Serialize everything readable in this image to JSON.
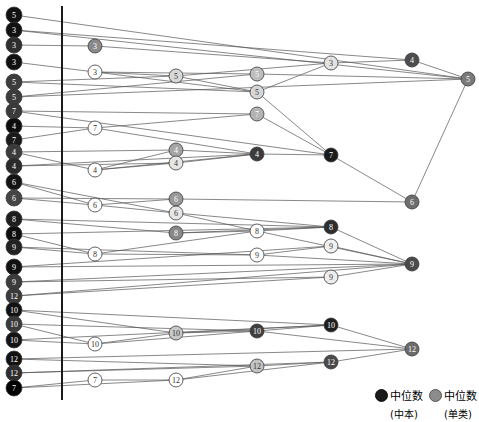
{
  "figure": {
    "type": "dendrogram-merge-diagram",
    "width": 479,
    "height": 422,
    "background": "#ffffff",
    "axis_line": {
      "x": 62,
      "y1": 6,
      "y2": 400,
      "color": "#1a1a1a",
      "width": 2
    }
  },
  "legend": {
    "items": [
      {
        "marker": "dark-circle",
        "color": "#1a1a1a",
        "label": "中位数",
        "sublabel": "(中本)"
      },
      {
        "marker": "light-circle",
        "color": "#8c8c8c",
        "label": "中位数",
        "sublabel": "(单类)"
      }
    ]
  },
  "chart_data": {
    "type": "scatter",
    "title": "",
    "xlabel": "",
    "ylabel": "",
    "xlim": [
      0,
      479
    ],
    "ylim": [
      0,
      422
    ],
    "grid": false,
    "legend_position": "bottom-right",
    "node_radius": {
      "leaf": 7.5,
      "inner": 6.5,
      "root": 7
    },
    "colors": {
      "dark": "#1a1a1a",
      "mid": "#4a4a4a",
      "grey": "#7d7d7d",
      "light": "#d9d9d9",
      "edge": "#555555"
    },
    "nodes": [
      {
        "id": "L0",
        "label": "5",
        "x": 14,
        "y": 15,
        "r": 8,
        "fill": "#111111",
        "text": "#ffffff",
        "col": 0
      },
      {
        "id": "L1",
        "label": "3",
        "x": 14,
        "y": 30,
        "r": 8,
        "fill": "#111111",
        "text": "#ffffff",
        "col": 0
      },
      {
        "id": "L2",
        "label": "3",
        "x": 14,
        "y": 45,
        "r": 8,
        "fill": "#2e2e2e",
        "text": "#ffffff",
        "col": 0
      },
      {
        "id": "L3",
        "label": "3",
        "x": 14,
        "y": 62,
        "r": 8,
        "fill": "#111111",
        "text": "#ffffff",
        "col": 0
      },
      {
        "id": "L4",
        "label": "5",
        "x": 14,
        "y": 82,
        "r": 8,
        "fill": "#3c3c3c",
        "text": "#ffffff",
        "col": 0
      },
      {
        "id": "L5",
        "label": "5",
        "x": 14,
        "y": 97,
        "r": 8,
        "fill": "#3c3c3c",
        "text": "#ffffff",
        "col": 0
      },
      {
        "id": "L6",
        "label": "7",
        "x": 14,
        "y": 111,
        "r": 8,
        "fill": "#3a3a3a",
        "text": "#ffffff",
        "col": 0
      },
      {
        "id": "L7",
        "label": "4",
        "x": 14,
        "y": 126,
        "r": 8,
        "fill": "#0d0d0d",
        "text": "#ffffff",
        "col": 0
      },
      {
        "id": "L8",
        "label": "7",
        "x": 14,
        "y": 140,
        "r": 8,
        "fill": "#1a1a1a",
        "text": "#ffffff",
        "col": 0
      },
      {
        "id": "L9",
        "label": "4",
        "x": 14,
        "y": 152,
        "r": 8,
        "fill": "#3c3c3c",
        "text": "#ffffff",
        "col": 0
      },
      {
        "id": "L10",
        "label": "4",
        "x": 14,
        "y": 166,
        "r": 8,
        "fill": "#2b2b2b",
        "text": "#ffffff",
        "col": 0
      },
      {
        "id": "L11",
        "label": "6",
        "x": 14,
        "y": 182,
        "r": 8,
        "fill": "#141414",
        "text": "#ffffff",
        "col": 0
      },
      {
        "id": "L12",
        "label": "6",
        "x": 14,
        "y": 198,
        "r": 8,
        "fill": "#454545",
        "text": "#ffffff",
        "col": 0
      },
      {
        "id": "L13",
        "label": "8",
        "x": 14,
        "y": 219,
        "r": 8,
        "fill": "#1e1e1e",
        "text": "#ffffff",
        "col": 0
      },
      {
        "id": "L14",
        "label": "8",
        "x": 14,
        "y": 234,
        "r": 8,
        "fill": "#0d0d0d",
        "text": "#ffffff",
        "col": 0
      },
      {
        "id": "L15",
        "label": "9",
        "x": 14,
        "y": 247,
        "r": 8,
        "fill": "#222222",
        "text": "#ffffff",
        "col": 0
      },
      {
        "id": "L16",
        "label": "9",
        "x": 14,
        "y": 267,
        "r": 8,
        "fill": "#111111",
        "text": "#ffffff",
        "col": 0
      },
      {
        "id": "L17",
        "label": "9",
        "x": 14,
        "y": 282,
        "r": 8,
        "fill": "#3c3c3c",
        "text": "#ffffff",
        "col": 0
      },
      {
        "id": "L18",
        "label": "12",
        "x": 14,
        "y": 296,
        "r": 8,
        "fill": "#3a3a3a",
        "text": "#ffffff",
        "col": 0
      },
      {
        "id": "L19",
        "label": "10",
        "x": 14,
        "y": 310,
        "r": 8,
        "fill": "#111111",
        "text": "#ffffff",
        "col": 0
      },
      {
        "id": "L20",
        "label": "10",
        "x": 14,
        "y": 324,
        "r": 8,
        "fill": "#3a3a3a",
        "text": "#ffffff",
        "col": 0
      },
      {
        "id": "L21",
        "label": "10",
        "x": 14,
        "y": 340,
        "r": 8,
        "fill": "#141414",
        "text": "#ffffff",
        "col": 0
      },
      {
        "id": "L22",
        "label": "12",
        "x": 14,
        "y": 359,
        "r": 8,
        "fill": "#111111",
        "text": "#ffffff",
        "col": 0
      },
      {
        "id": "L23",
        "label": "12",
        "x": 14,
        "y": 373,
        "r": 8,
        "fill": "#2e2e2e",
        "text": "#ffffff",
        "col": 0
      },
      {
        "id": "L24",
        "label": "7",
        "x": 14,
        "y": 388,
        "r": 8,
        "fill": "#000000",
        "text": "#ffffff",
        "col": 0
      },
      {
        "id": "A0",
        "label": "3",
        "x": 95,
        "y": 46,
        "r": 7,
        "fill": "#8a8a8a",
        "text": "#ffffff",
        "col": 1
      },
      {
        "id": "A1",
        "label": "3",
        "x": 95,
        "y": 72,
        "r": 7,
        "fill": "#ffffff",
        "text": "#333333",
        "col": 1
      },
      {
        "id": "A2",
        "label": "7",
        "x": 95,
        "y": 128,
        "r": 7,
        "fill": "#ffffff",
        "text": "#333333",
        "col": 1
      },
      {
        "id": "A3",
        "label": "4",
        "x": 95,
        "y": 170,
        "r": 7,
        "fill": "#ffffff",
        "text": "#333333",
        "col": 1
      },
      {
        "id": "A4",
        "label": "6",
        "x": 95,
        "y": 205,
        "r": 7,
        "fill": "#ffffff",
        "text": "#333333",
        "col": 1
      },
      {
        "id": "A5",
        "label": "8",
        "x": 95,
        "y": 254,
        "r": 7,
        "fill": "#ffffff",
        "text": "#333333",
        "col": 1
      },
      {
        "id": "A6",
        "label": "10",
        "x": 95,
        "y": 344,
        "r": 7,
        "fill": "#ffffff",
        "text": "#333333",
        "col": 1
      },
      {
        "id": "A7",
        "label": "7",
        "x": 95,
        "y": 380,
        "r": 7,
        "fill": "#ffffff",
        "text": "#333333",
        "col": 1
      },
      {
        "id": "B0",
        "label": "5",
        "x": 176,
        "y": 76,
        "r": 7,
        "fill": "#d8d8d8",
        "text": "#333333",
        "col": 2
      },
      {
        "id": "B1",
        "label": "4",
        "x": 176,
        "y": 150,
        "r": 7,
        "fill": "#a6a6a6",
        "text": "#ffffff",
        "col": 2
      },
      {
        "id": "B2",
        "label": "4",
        "x": 176,
        "y": 163,
        "r": 7,
        "fill": "#e6e6e6",
        "text": "#333333",
        "col": 2
      },
      {
        "id": "B3",
        "label": "6",
        "x": 176,
        "y": 199,
        "r": 7,
        "fill": "#9a9a9a",
        "text": "#ffffff",
        "col": 2
      },
      {
        "id": "B4",
        "label": "6",
        "x": 176,
        "y": 213,
        "r": 7,
        "fill": "#e6e6e6",
        "text": "#333333",
        "col": 2
      },
      {
        "id": "B5",
        "label": "8",
        "x": 176,
        "y": 233,
        "r": 7,
        "fill": "#888888",
        "text": "#ffffff",
        "col": 2
      },
      {
        "id": "B6",
        "label": "10",
        "x": 176,
        "y": 333,
        "r": 7,
        "fill": "#c8c8c8",
        "text": "#333333",
        "col": 2
      },
      {
        "id": "B7",
        "label": "12",
        "x": 176,
        "y": 380,
        "r": 7,
        "fill": "#ffffff",
        "text": "#333333",
        "col": 2
      },
      {
        "id": "C0",
        "label": "5",
        "x": 257,
        "y": 74,
        "r": 7,
        "fill": "#bdbdbd",
        "text": "#ffffff",
        "col": 3
      },
      {
        "id": "C1",
        "label": "5",
        "x": 257,
        "y": 92,
        "r": 7,
        "fill": "#d6d6d6",
        "text": "#333333",
        "col": 3
      },
      {
        "id": "C2",
        "label": "7",
        "x": 257,
        "y": 114,
        "r": 7,
        "fill": "#b3b3b3",
        "text": "#ffffff",
        "col": 3
      },
      {
        "id": "C3",
        "label": "4",
        "x": 257,
        "y": 154,
        "r": 7,
        "fill": "#3c3c3c",
        "text": "#ffffff",
        "col": 3
      },
      {
        "id": "C4",
        "label": "8",
        "x": 257,
        "y": 231,
        "r": 7,
        "fill": "#ffffff",
        "text": "#333333",
        "col": 3
      },
      {
        "id": "C5",
        "label": "9",
        "x": 257,
        "y": 255,
        "r": 7,
        "fill": "#ffffff",
        "text": "#333333",
        "col": 3
      },
      {
        "id": "C6",
        "label": "10",
        "x": 257,
        "y": 331,
        "r": 7,
        "fill": "#3f3f3f",
        "text": "#ffffff",
        "col": 3
      },
      {
        "id": "C7",
        "label": "12",
        "x": 257,
        "y": 366,
        "r": 7,
        "fill": "#c2c2c2",
        "text": "#333333",
        "col": 3
      },
      {
        "id": "D0",
        "label": "3",
        "x": 331,
        "y": 63,
        "r": 7,
        "fill": "#e2e2e2",
        "text": "#333333",
        "col": 4
      },
      {
        "id": "D1",
        "label": "7",
        "x": 331,
        "y": 155,
        "r": 7,
        "fill": "#1a1a1a",
        "text": "#ffffff",
        "col": 4
      },
      {
        "id": "D2",
        "label": "8",
        "x": 331,
        "y": 227,
        "r": 7,
        "fill": "#2e2e2e",
        "text": "#ffffff",
        "col": 4
      },
      {
        "id": "D3",
        "label": "9",
        "x": 331,
        "y": 246,
        "r": 7,
        "fill": "#f0f0f0",
        "text": "#333333",
        "col": 4
      },
      {
        "id": "D4",
        "label": "9",
        "x": 331,
        "y": 277,
        "r": 7,
        "fill": "#ededed",
        "text": "#333333",
        "col": 4
      },
      {
        "id": "D5",
        "label": "10",
        "x": 331,
        "y": 325,
        "r": 7,
        "fill": "#1e1e1e",
        "text": "#ffffff",
        "col": 4
      },
      {
        "id": "D6",
        "label": "12",
        "x": 331,
        "y": 362,
        "r": 7,
        "fill": "#4a4a4a",
        "text": "#ffffff",
        "col": 4
      },
      {
        "id": "E0",
        "label": "4",
        "x": 412,
        "y": 60,
        "r": 7,
        "fill": "#4d4d4d",
        "text": "#ffffff",
        "col": 5
      },
      {
        "id": "E1",
        "label": "6",
        "x": 412,
        "y": 202,
        "r": 7,
        "fill": "#6e6e6e",
        "text": "#ffffff",
        "col": 5
      },
      {
        "id": "E2",
        "label": "9",
        "x": 412,
        "y": 264,
        "r": 7,
        "fill": "#4a4a4a",
        "text": "#ffffff",
        "col": 5
      },
      {
        "id": "E3",
        "label": "12",
        "x": 412,
        "y": 349,
        "r": 7,
        "fill": "#6b6b6b",
        "text": "#ffffff",
        "col": 5
      },
      {
        "id": "R0",
        "label": "5",
        "x": 468,
        "y": 79,
        "r": 7,
        "fill": "#7a7a7a",
        "text": "#ffffff",
        "col": 6
      }
    ],
    "edges": [
      {
        "from": "L0",
        "to": "R0"
      },
      {
        "from": "L1",
        "to": "E0"
      },
      {
        "from": "L2",
        "to": "A0"
      },
      {
        "from": "A0",
        "to": "D0"
      },
      {
        "from": "L3",
        "to": "A1"
      },
      {
        "from": "A1",
        "to": "B0"
      },
      {
        "from": "A1",
        "to": "C0"
      },
      {
        "from": "A1",
        "to": "C1"
      },
      {
        "from": "L4",
        "to": "B0"
      },
      {
        "from": "L5",
        "to": "C0"
      },
      {
        "from": "B0",
        "to": "C1"
      },
      {
        "from": "B0",
        "to": "D0"
      },
      {
        "from": "C0",
        "to": "R0"
      },
      {
        "from": "C1",
        "to": "D0"
      },
      {
        "from": "D0",
        "to": "E0"
      },
      {
        "from": "E0",
        "to": "R0"
      },
      {
        "from": "L6",
        "to": "C2"
      },
      {
        "from": "L7",
        "to": "A2"
      },
      {
        "from": "L8",
        "to": "A2"
      },
      {
        "from": "A2",
        "to": "C2"
      },
      {
        "from": "A2",
        "to": "C3"
      },
      {
        "from": "L9",
        "to": "B1"
      },
      {
        "from": "L10",
        "to": "B2"
      },
      {
        "from": "A3",
        "to": "B1"
      },
      {
        "from": "A3",
        "to": "B2"
      },
      {
        "from": "A3",
        "to": "C3"
      },
      {
        "from": "L9",
        "to": "A3"
      },
      {
        "from": "B1",
        "to": "C3"
      },
      {
        "from": "B2",
        "to": "C3"
      },
      {
        "from": "C2",
        "to": "D1"
      },
      {
        "from": "C3",
        "to": "D1"
      },
      {
        "from": "D1",
        "to": "E1"
      },
      {
        "from": "C1",
        "to": "D1"
      },
      {
        "from": "L11",
        "to": "A4"
      },
      {
        "from": "L12",
        "to": "A4"
      },
      {
        "from": "A4",
        "to": "B3"
      },
      {
        "from": "A4",
        "to": "B4"
      },
      {
        "from": "B3",
        "to": "E1"
      },
      {
        "from": "B4",
        "to": "C4"
      },
      {
        "from": "B4",
        "to": "D2"
      },
      {
        "from": "L13",
        "to": "B5"
      },
      {
        "from": "L14",
        "to": "A5"
      },
      {
        "from": "L15",
        "to": "A5"
      },
      {
        "from": "A5",
        "to": "C4"
      },
      {
        "from": "A5",
        "to": "C5"
      },
      {
        "from": "B5",
        "to": "C4"
      },
      {
        "from": "B5",
        "to": "D2"
      },
      {
        "from": "C4",
        "to": "D2"
      },
      {
        "from": "C4",
        "to": "E2"
      },
      {
        "from": "C5",
        "to": "D3"
      },
      {
        "from": "C5",
        "to": "E2"
      },
      {
        "from": "D2",
        "to": "E2"
      },
      {
        "from": "D3",
        "to": "E2"
      },
      {
        "from": "L16",
        "to": "D3"
      },
      {
        "from": "L17",
        "to": "D4"
      },
      {
        "from": "D4",
        "to": "E2"
      },
      {
        "from": "L18",
        "to": "D4"
      },
      {
        "from": "L19",
        "to": "B6"
      },
      {
        "from": "L20",
        "to": "A6"
      },
      {
        "from": "L21",
        "to": "A6"
      },
      {
        "from": "A6",
        "to": "B6"
      },
      {
        "from": "A6",
        "to": "C6"
      },
      {
        "from": "B6",
        "to": "C6"
      },
      {
        "from": "B6",
        "to": "D5"
      },
      {
        "from": "C6",
        "to": "D5"
      },
      {
        "from": "C6",
        "to": "E3"
      },
      {
        "from": "D5",
        "to": "E3"
      },
      {
        "from": "L22",
        "to": "C7"
      },
      {
        "from": "L23",
        "to": "C7"
      },
      {
        "from": "L24",
        "to": "A7"
      },
      {
        "from": "A7",
        "to": "B7"
      },
      {
        "from": "B7",
        "to": "C7"
      },
      {
        "from": "B7",
        "to": "D6"
      },
      {
        "from": "C7",
        "to": "D6"
      },
      {
        "from": "D6",
        "to": "E3"
      },
      {
        "from": "E1",
        "to": "R0"
      },
      {
        "from": "L12",
        "to": "B3"
      },
      {
        "from": "L13",
        "to": "D2"
      },
      {
        "from": "L16",
        "to": "E2"
      },
      {
        "from": "L19",
        "to": "D5"
      },
      {
        "from": "L22",
        "to": "E3"
      },
      {
        "from": "L23",
        "to": "D6"
      },
      {
        "from": "L24",
        "to": "B7"
      },
      {
        "from": "L4",
        "to": "C1"
      },
      {
        "from": "L6",
        "to": "D1"
      },
      {
        "from": "L11",
        "to": "B4"
      },
      {
        "from": "L15",
        "to": "C5"
      },
      {
        "from": "L17",
        "to": "E2"
      },
      {
        "from": "L20",
        "to": "C6"
      },
      {
        "from": "L21",
        "to": "D5"
      },
      {
        "from": "L18",
        "to": "E2"
      },
      {
        "from": "L10",
        "to": "C3"
      },
      {
        "from": "L5",
        "to": "R0"
      },
      {
        "from": "L1",
        "to": "R0"
      },
      {
        "from": "L14",
        "to": "D2"
      }
    ]
  }
}
